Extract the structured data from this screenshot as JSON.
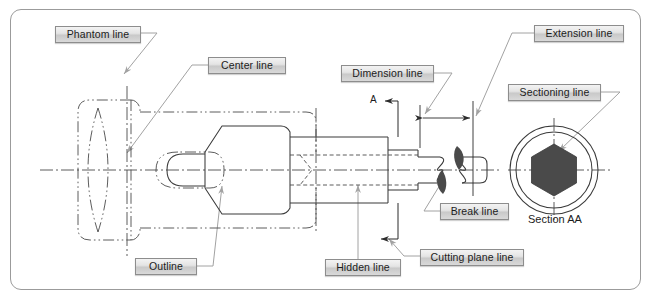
{
  "figure": {
    "kind": "engineering-drawing-line-types",
    "border_color": "#9b9b9b",
    "line_color": "#3a3a3a",
    "leader_color": "#9a9a9a",
    "hatch_fill": "#4a4a4a"
  },
  "callouts": [
    {
      "id": "phantom-line",
      "label": "Phantom line",
      "x": 55,
      "y": 26,
      "w": 86,
      "h": 17
    },
    {
      "id": "center-line",
      "label": "Center line",
      "x": 208,
      "y": 57,
      "w": 78,
      "h": 17
    },
    {
      "id": "dimension-line",
      "label": "Dimension line",
      "x": 341,
      "y": 65,
      "w": 93,
      "h": 17
    },
    {
      "id": "extension-line",
      "label": "Extension line",
      "x": 534,
      "y": 25,
      "w": 90,
      "h": 17
    },
    {
      "id": "sectioning-line",
      "label": "Sectioning line",
      "x": 508,
      "y": 84,
      "w": 93,
      "h": 17
    },
    {
      "id": "break-line",
      "label": "Break line",
      "x": 440,
      "y": 203,
      "w": 69,
      "h": 17
    },
    {
      "id": "outline",
      "label": "Outline",
      "x": 135,
      "y": 258,
      "w": 62,
      "h": 17
    },
    {
      "id": "hidden-line",
      "label": "Hidden line",
      "x": 325,
      "y": 259,
      "w": 76,
      "h": 17
    },
    {
      "id": "cutting-plane-line",
      "label": "Cutting plane line",
      "x": 420,
      "y": 249,
      "w": 104,
      "h": 17
    }
  ],
  "annotations": [
    {
      "id": "section-view-title",
      "label": "Section AA",
      "x": 528,
      "y": 219
    },
    {
      "id": "section-cut-letter",
      "label": "A",
      "x": 372,
      "y": 93
    }
  ],
  "section_view": {
    "center_x": 554,
    "center_y": 170,
    "outer_radius": 44,
    "inner_radius": 38,
    "hex_radius": 26,
    "title": "Section AA"
  },
  "dimension": {
    "left_x": 420,
    "right_x": 473,
    "y": 118,
    "value": ""
  }
}
